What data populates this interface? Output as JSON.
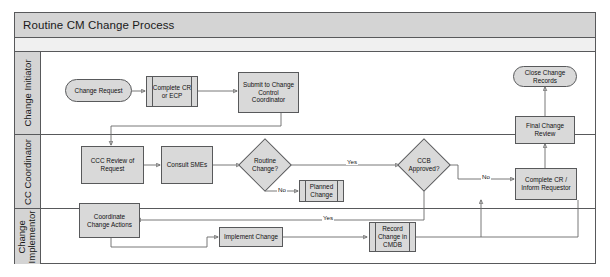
{
  "diagram": {
    "title": "Routine CM Change Process",
    "lanes": [
      {
        "id": "lane-change-initiator",
        "label": "Change Initiator"
      },
      {
        "id": "lane-cc-coordinator",
        "label": "CC Coordinator"
      },
      {
        "id": "lane-change-implementor",
        "label": "Change\nImplementor"
      }
    ],
    "nodes": {
      "change_request": {
        "label": "Change Request",
        "shape": "terminal"
      },
      "complete_cr_ecp": {
        "label": "Complete CR\nor ECP",
        "shape": "predefined-process"
      },
      "submit_to_ccc": {
        "label": "Submit to Change\nControl\nCoordinator",
        "shape": "process"
      },
      "close_change_records": {
        "label": "Close Change\nRecords",
        "shape": "terminal"
      },
      "ccc_review": {
        "label": "CCC Review of\nRequest",
        "shape": "process"
      },
      "consult_smes": {
        "label": "Consult SMEs",
        "shape": "process"
      },
      "routine_change": {
        "label": "Routine\nChange?",
        "shape": "decision"
      },
      "planned_change": {
        "label": "Planned\nChange",
        "shape": "predefined-process"
      },
      "ccb_approved": {
        "label": "CCB\nApproved?",
        "shape": "decision"
      },
      "final_change_review": {
        "label": "Final Change\nReview",
        "shape": "process"
      },
      "complete_cr_inform": {
        "label": "Complete CR /\nInform Requestor",
        "shape": "process"
      },
      "coordinate_change": {
        "label": "Coordinate\nChange Actions",
        "shape": "process"
      },
      "implement_change": {
        "label": "Implement Change",
        "shape": "process"
      },
      "record_change_cmdb": {
        "label": "Record\nChange in\nCMDB",
        "shape": "predefined-process"
      }
    },
    "edge_labels": {
      "routine_no": "No",
      "routine_yes": "Yes",
      "ccb_no": "No",
      "ccb_yes": "Yes"
    },
    "colors": {
      "shape_fill": "#d9d9d9",
      "shape_stroke": "#58595b",
      "lane_header_fill": "#d4d4d4",
      "connector": "#6a6a6a",
      "page_background": "#ffffff"
    }
  }
}
